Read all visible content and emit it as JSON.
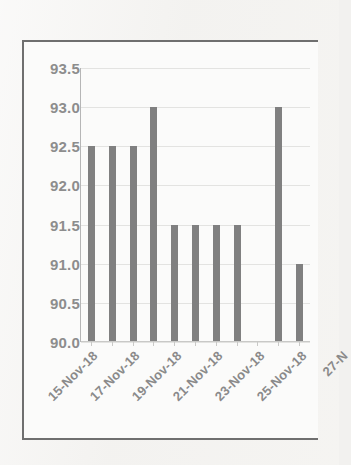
{
  "chart_data": {
    "type": "bar",
    "title": "",
    "xlabel": "",
    "ylabel": "",
    "ylim": [
      90.0,
      93.5
    ],
    "ystep": 0.5,
    "grid": true,
    "legend": false,
    "bar_color": "#808080",
    "categories": [
      "15-Nov-18",
      "16-Nov-18",
      "17-Nov-18",
      "18-Nov-18",
      "19-Nov-18",
      "20-Nov-18",
      "21-Nov-18",
      "22-Nov-18",
      "23-Nov-18",
      "24-Nov-18",
      "25-Nov-18"
    ],
    "values": [
      92.5,
      92.5,
      92.5,
      93.0,
      91.5,
      91.5,
      91.5,
      91.5,
      null,
      93.0,
      91.0
    ],
    "ytick_labels": [
      "93.5",
      "93.0",
      "92.5",
      "92.0",
      "91.5",
      "91.0",
      "90.5",
      "90.0"
    ],
    "ytick_values": [
      93.5,
      93.0,
      92.5,
      92.0,
      91.5,
      91.0,
      90.5,
      90.0
    ],
    "xtick_labels": [
      "15-Nov-18",
      "17-Nov-18",
      "19-Nov-18",
      "21-Nov-18",
      "23-Nov-18",
      "25-Nov-18",
      "27-N"
    ],
    "xtick_label_indices": [
      0,
      2,
      4,
      6,
      8,
      10,
      12
    ],
    "xtick_rotation_deg": -45
  }
}
